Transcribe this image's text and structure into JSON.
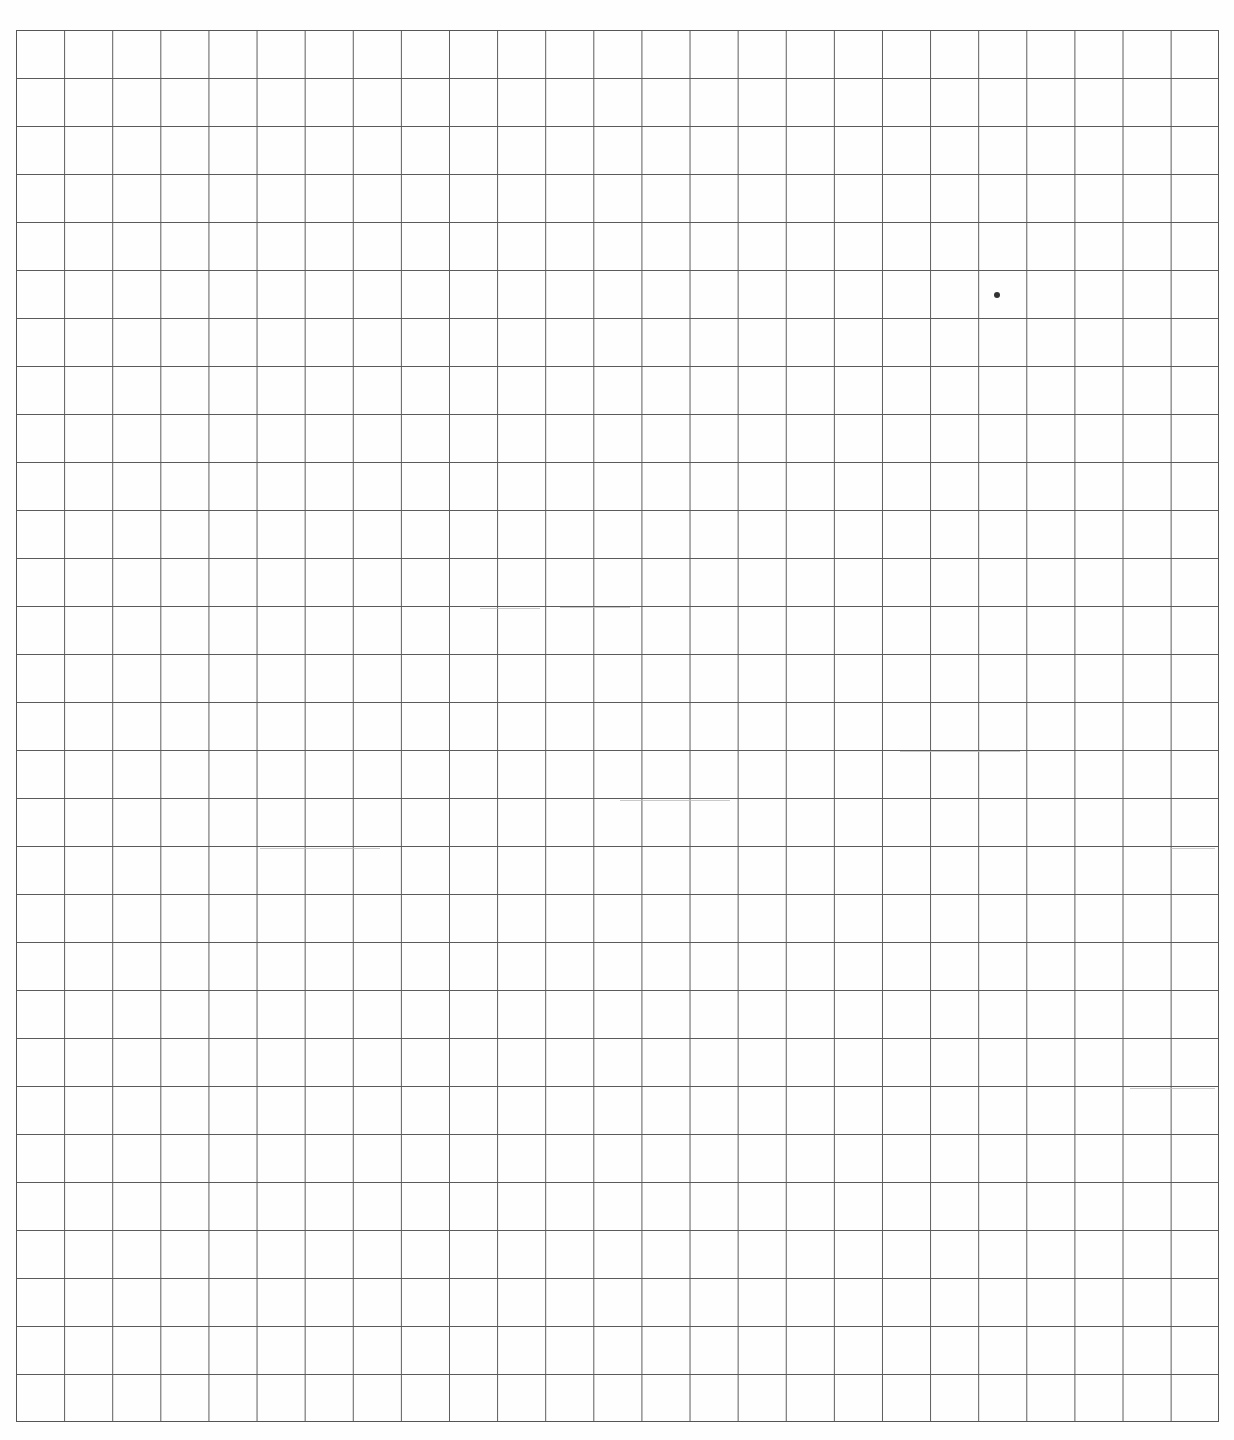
{
  "document": {
    "type": "graph paper",
    "grid": {
      "columns": 25,
      "rows": 29,
      "cell_size_px": 48,
      "line_color": "#5a5a5a",
      "background_color": "#fefefe"
    },
    "marks": [
      {
        "type": "dot",
        "x": 997,
        "y": 295
      }
    ]
  }
}
